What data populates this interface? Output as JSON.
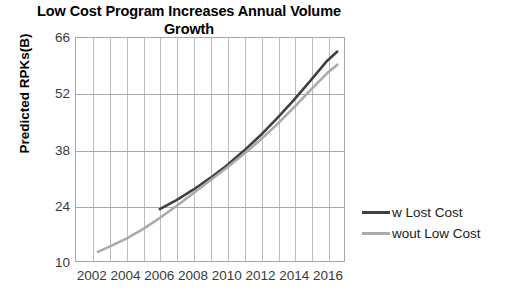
{
  "chart_data": {
    "type": "line",
    "title": "Low Cost Program Increases Annual Volume Growth",
    "title_line1": "Low Cost Program Increases Annual Volume",
    "title_line2": "Growth",
    "xlabel": "",
    "ylabel": "Predicted RPKs(B)",
    "xlim": [
      2001,
      2017
    ],
    "ylim": [
      10,
      66
    ],
    "yticks": [
      10,
      24,
      38,
      52,
      66
    ],
    "xticks": [
      2002,
      2004,
      2006,
      2008,
      2010,
      2012,
      2014,
      2016
    ],
    "grid": "both",
    "grid_x_step": 1,
    "legend_position": "right",
    "colors": {
      "with_low_cost": "#404040",
      "without_low_cost": "#aaaaaa",
      "grid": "#bdbdbd",
      "frame": "#a8a8a8",
      "text": "#3a3a3a"
    },
    "series": [
      {
        "name": "w Lost Cost",
        "color": "#404040",
        "x": [
          2006,
          2007,
          2008,
          2009,
          2010,
          2011,
          2012,
          2013,
          2014,
          2015,
          2016,
          2016.6
        ],
        "values": [
          23.0,
          25.3,
          27.9,
          30.8,
          34.0,
          37.6,
          41.5,
          45.8,
          50.4,
          55.3,
          60.3,
          62.6
        ]
      },
      {
        "name": "wout Low Cost",
        "color": "#aaaaaa",
        "x": [
          2002.3,
          2003,
          2004,
          2005,
          2006,
          2007,
          2008,
          2009,
          2010,
          2011,
          2012,
          2013,
          2014,
          2015,
          2016,
          2016.6
        ],
        "values": [
          12.3,
          13.6,
          15.6,
          18.0,
          20.8,
          23.8,
          27.0,
          30.2,
          33.4,
          36.8,
          40.4,
          44.3,
          48.5,
          52.9,
          57.2,
          59.3
        ]
      }
    ]
  },
  "legend": {
    "items": [
      {
        "label": "w Lost Cost",
        "color": "#404040"
      },
      {
        "label": "wout Low Cost",
        "color": "#aaaaaa"
      }
    ]
  }
}
